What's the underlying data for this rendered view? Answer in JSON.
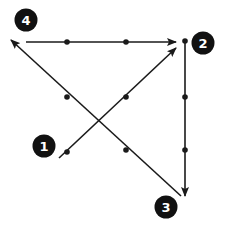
{
  "diagram": {
    "title": "",
    "colors": {
      "stroke": "#1a1a1a",
      "badge_fill": "#111111",
      "badge_text": "#ffffff",
      "background": "#ffffff"
    },
    "points": [
      {
        "id": "1",
        "label": "1",
        "badge": {
          "x": 44,
          "y": 146
        },
        "anchor": {
          "x": 59,
          "y": 158
        }
      },
      {
        "id": "2",
        "label": "2",
        "badge": {
          "x": 203,
          "y": 43
        },
        "anchor": {
          "x": 185,
          "y": 41
        }
      },
      {
        "id": "3",
        "label": "3",
        "badge": {
          "x": 166,
          "y": 207
        },
        "anchor": {
          "x": 181,
          "y": 196
        }
      },
      {
        "id": "4",
        "label": "4",
        "badge": {
          "x": 26,
          "y": 20
        },
        "anchor": {
          "x": 11,
          "y": 40
        }
      }
    ],
    "arrows": [
      {
        "from": "1",
        "to": "2",
        "start": [
          59,
          158
        ],
        "end": [
          176,
          48
        ],
        "dots": [
          [
            67,
            152
          ],
          [
            126,
            97
          ]
        ]
      },
      {
        "from": "2",
        "to": "3",
        "start": [
          185,
          41
        ],
        "end": [
          185,
          196
        ],
        "dots": [
          [
            185,
            97
          ],
          [
            185,
            150
          ]
        ]
      },
      {
        "from": "3",
        "to": "4",
        "start": [
          181,
          196
        ],
        "end": [
          11,
          40
        ],
        "dots": [
          [
            126,
            150
          ],
          [
            67,
            97
          ]
        ]
      },
      {
        "from": "4",
        "to": "2",
        "start": [
          26,
          42
        ],
        "end": [
          176,
          42
        ],
        "dots": [
          [
            67,
            42
          ],
          [
            126,
            42
          ]
        ]
      }
    ],
    "vertex_dot": [
      185,
      41
    ]
  }
}
